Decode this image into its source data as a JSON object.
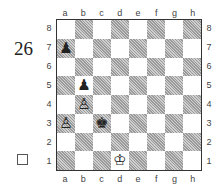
{
  "diagram": {
    "number": "26",
    "side_to_move": "white",
    "files": [
      "a",
      "b",
      "c",
      "d",
      "e",
      "f",
      "g",
      "h"
    ],
    "ranks": [
      "8",
      "7",
      "6",
      "5",
      "4",
      "3",
      "2",
      "1"
    ],
    "pieces": [
      {
        "square": "a7",
        "piece": "pawn",
        "color": "black",
        "glyph": "♟"
      },
      {
        "square": "b5",
        "piece": "pawn",
        "color": "black",
        "glyph": "♟"
      },
      {
        "square": "b4",
        "piece": "pawn",
        "color": "white",
        "glyph": "♙"
      },
      {
        "square": "a3",
        "piece": "pawn",
        "color": "white",
        "glyph": "♙"
      },
      {
        "square": "c3",
        "piece": "king",
        "color": "black",
        "glyph": "♚"
      },
      {
        "square": "d1",
        "piece": "king",
        "color": "white",
        "glyph": "♔"
      }
    ]
  }
}
